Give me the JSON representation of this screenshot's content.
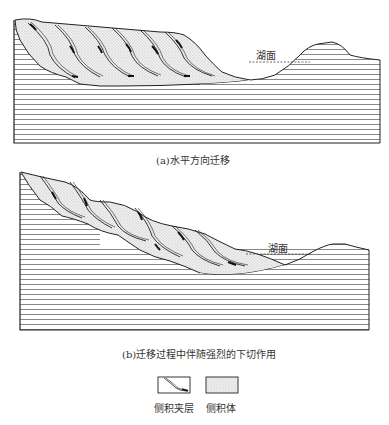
{
  "panel_a": {
    "caption": "(a)水平方向迁移",
    "water_label": "湖面"
  },
  "panel_b": {
    "caption": "(b)迁移过程中伴随强烈的下切作用",
    "water_label": "湖面"
  },
  "legend": {
    "items": [
      {
        "label": "侧积夹层",
        "swatch": "lateral-accretion-interlayer"
      },
      {
        "label": "侧积体",
        "swatch": "lateral-accretion-body"
      }
    ]
  },
  "colors": {
    "line": "#222222",
    "strata": "#555555",
    "dots": "#9a9a9a",
    "fill": "#ececec"
  }
}
